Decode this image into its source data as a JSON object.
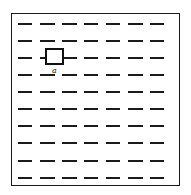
{
  "diagram": {
    "rows": 10,
    "dashes_per_row": 7,
    "marker": {
      "label": "a",
      "row": 3,
      "column": 2
    },
    "colors": {
      "line": "#1a1a1a",
      "background": "#ffffff"
    }
  }
}
